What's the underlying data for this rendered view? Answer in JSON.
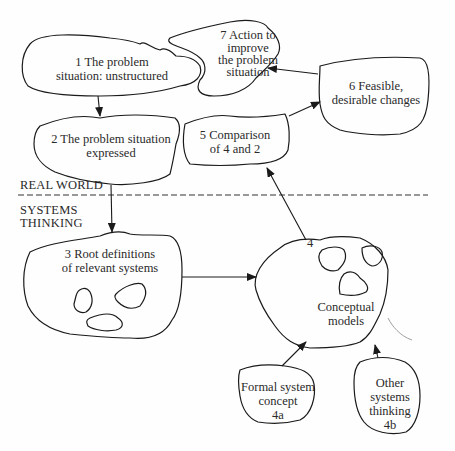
{
  "diagram": {
    "zones": {
      "upper": "REAL WORLD",
      "lower_line1": "SYSTEMS",
      "lower_line2": "THINKING"
    },
    "nodes": [
      {
        "id": "1",
        "lines": [
          "1  The problem",
          "situation: unstructured"
        ]
      },
      {
        "id": "2",
        "lines": [
          "2  The problem situation",
          "expressed"
        ]
      },
      {
        "id": "3",
        "lines": [
          "3  Root definitions",
          "of relevant systems"
        ]
      },
      {
        "id": "4",
        "number": "4",
        "lines": [
          "Conceptual",
          "models"
        ]
      },
      {
        "id": "4a",
        "lines": [
          "Formal system",
          "concept",
          "4a"
        ]
      },
      {
        "id": "4b",
        "lines": [
          "Other",
          "systems",
          "thinking",
          "4b"
        ]
      },
      {
        "id": "5",
        "lines": [
          "5  Comparison",
          "of 4 and 2"
        ]
      },
      {
        "id": "6",
        "lines": [
          "6  Feasible,",
          "desirable changes"
        ]
      },
      {
        "id": "7",
        "lines": [
          "7  Action to",
          "improve",
          "the problem",
          "situation"
        ]
      }
    ],
    "edges": [
      {
        "from": "1",
        "to": "2"
      },
      {
        "from": "2",
        "to": "3"
      },
      {
        "from": "3",
        "to": "4"
      },
      {
        "from": "4a",
        "to": "4"
      },
      {
        "from": "4b",
        "to": "4"
      },
      {
        "from": "4",
        "to": "5"
      },
      {
        "from": "5",
        "to": "6"
      },
      {
        "from": "6",
        "to": "7"
      }
    ],
    "colors": {
      "ink": "#1a1a1a",
      "background": "#fefefe"
    }
  }
}
